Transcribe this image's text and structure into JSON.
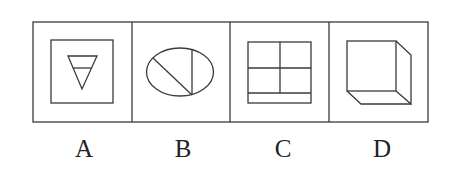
{
  "figure": {
    "type": "figure-reasoning-options",
    "stroke_color": "#3a3a3a",
    "background": "#ffffff",
    "options": [
      {
        "label": "A",
        "shape": "square containing an inverted triangle split by a horizontal line"
      },
      {
        "label": "B",
        "shape": "ellipse with a vertical chord and a diagonal chord meeting at bottom"
      },
      {
        "label": "C",
        "shape": "rectangle divided into four cells plus a bottom strip"
      },
      {
        "label": "D",
        "shape": "cube drawn in oblique projection"
      }
    ]
  }
}
